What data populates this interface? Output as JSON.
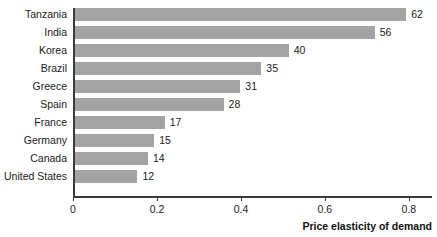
{
  "chart_data": {
    "type": "bar",
    "orientation": "horizontal",
    "title": "",
    "xlabel": "Price elasticity of demand",
    "ylabel": "",
    "categories": [
      "Tanzania",
      "India",
      "Korea",
      "Brazil",
      "Greece",
      "Spain",
      "France",
      "Germany",
      "Canada",
      "United States"
    ],
    "values": [
      62,
      56,
      40,
      35,
      31,
      28,
      17,
      15,
      14,
      12
    ],
    "value_labels": [
      "62",
      "56",
      "40",
      "35",
      "31",
      "28",
      "17",
      "15",
      "14",
      "12"
    ],
    "bar_extents": [
      0.79,
      0.715,
      0.51,
      0.445,
      0.395,
      0.355,
      0.215,
      0.19,
      0.175,
      0.15
    ],
    "xticks": [
      0,
      0.2,
      0.4,
      0.6,
      0.8
    ],
    "xtick_labels": [
      "0",
      "0.2",
      "0.4",
      "0.6",
      "0.8"
    ],
    "xlim": [
      0,
      0.855
    ],
    "grid": false,
    "legend": null,
    "bar_color": "#a3a3a3",
    "axis_color": "#3a3a3a",
    "text_color": "#1a1a1a"
  }
}
